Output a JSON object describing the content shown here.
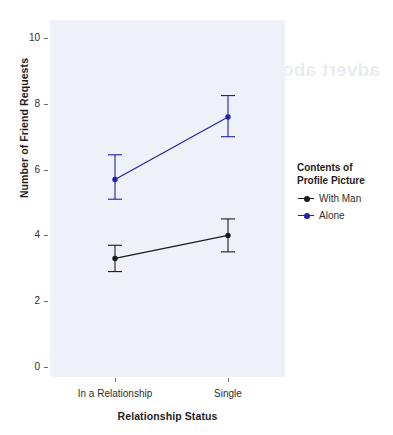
{
  "chart_data": {
    "type": "line",
    "title": "",
    "subtitle": "",
    "xlabel": "Relationship Status",
    "ylabel": "Number of Friend Requests",
    "categories": [
      "In a Relationship",
      "Single"
    ],
    "ylim": [
      0,
      10.6
    ],
    "yticks": [
      0,
      2,
      4,
      6,
      8,
      10
    ],
    "ytick_labels": [
      "0",
      "2",
      "4",
      "6",
      "8",
      "10"
    ],
    "grid": false,
    "legend_position": "right",
    "legend_title": "Contents of Profile Picture",
    "legend_title_line1": "Contents of",
    "legend_title_line2": "Profile Picture",
    "series": [
      {
        "name": "With Man",
        "color": "#1a1a1a",
        "values": [
          3.3,
          4.0
        ],
        "error_low": [
          2.9,
          3.5
        ],
        "error_high": [
          3.7,
          4.5
        ]
      },
      {
        "name": "Alone",
        "color": "#2222a8",
        "values": [
          5.7,
          7.6
        ],
        "error_low": [
          5.1,
          7.0
        ],
        "error_high": [
          6.45,
          8.25
        ]
      }
    ],
    "panel_background": "#eef1f7",
    "axis_color": "#6d6d6d",
    "text_color": "#2f2f2f"
  },
  "artifact": {
    "bleed_text": "advert about statistics"
  }
}
